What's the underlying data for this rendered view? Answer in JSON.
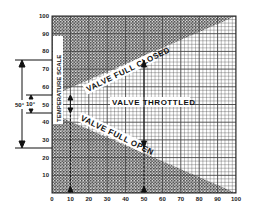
{
  "chart_data": {
    "type": "area",
    "title": "",
    "xlabel": "",
    "ylabel": "TEMPERATURE SCALE",
    "xlim": [
      0,
      100
    ],
    "ylim": [
      0,
      100
    ],
    "x_ticks": [
      "0",
      "10",
      "20",
      "30",
      "40",
      "50",
      "60",
      "70",
      "80",
      "90",
      "100"
    ],
    "y_ticks": [
      "10",
      "20",
      "30",
      "40",
      "50",
      "60",
      "70",
      "80",
      "90",
      "100"
    ],
    "grid": true,
    "regions": [
      {
        "name": "VALVE FULL CLOSED",
        "boundary": {
          "x": [
            0,
            100
          ],
          "y": [
            55,
            100
          ]
        },
        "fill": "above",
        "shaded": true
      },
      {
        "name": "VALVE THROTTLED",
        "between": true,
        "shaded": false
      },
      {
        "name": "VALVE FULL OPEN",
        "boundary": {
          "x": [
            0,
            100
          ],
          "y": [
            45,
            0
          ]
        },
        "fill": "below",
        "shaded": true
      }
    ],
    "annotations": [
      {
        "text": "10°",
        "type": "span",
        "y_range": [
          45,
          55
        ],
        "at_x": 10
      },
      {
        "text": "50°",
        "type": "span",
        "y_range": [
          25,
          75
        ],
        "at_x": 50
      }
    ]
  },
  "labels": {
    "closed": "VALVE FULL CLOSED",
    "throttled": "VALVE THROTTLED",
    "open": "VALVE FULL OPEN",
    "scale": "TEMPERATURE SCALE",
    "span_small": "10°",
    "span_large": "50°"
  },
  "colors": {
    "grid": "#333333",
    "shade": "#8a8a8a",
    "background": "#ffffff"
  }
}
